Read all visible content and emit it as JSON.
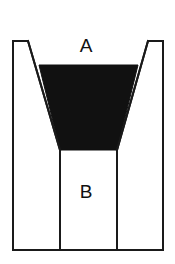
{
  "figure": {
    "type": "technical-diagram",
    "background_color": "#ffffff",
    "outline_color": "#1a1a1a",
    "fill_color": "#111111",
    "canvas": {
      "width": 175,
      "height": 264
    }
  },
  "labels": {
    "region_a": "A",
    "region_b": "B"
  },
  "label_positions": {
    "region_a": {
      "x": 86,
      "y": 47
    },
    "region_b": {
      "x": 86,
      "y": 193
    }
  },
  "geometry": {
    "container_outline_points": "13,41 28,41 60,150 60,250 117,250 117,150 148,41 163,41 163,250 13,250",
    "container_left_wall_x": 13,
    "container_right_wall_x": 163,
    "container_top_y": 41,
    "container_bottom_y": 250,
    "left_cap_x1": 13,
    "left_cap_x2": 28,
    "right_cap_x1": 148,
    "right_cap_x2": 163,
    "funnel_top_left_x": 28,
    "funnel_top_right_x": 148,
    "funnel_bottom_left_x": 60,
    "funnel_bottom_right_x": 117,
    "funnel_bottom_y": 150,
    "fill_polygon_points": "39,65 138,65 117,150 60,150",
    "fill_top_y": 65,
    "fill_top_left_x": 39,
    "fill_top_right_x": 138
  },
  "stroke": {
    "outline_width": 2,
    "inner_width": 2
  }
}
